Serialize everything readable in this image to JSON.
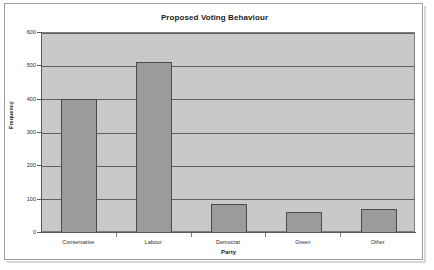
{
  "chart_data": {
    "type": "bar",
    "title": "Proposed Voting Behaviour",
    "xlabel": "Party",
    "ylabel": "Frequency",
    "categories": [
      "Conservative",
      "Labour",
      "Democrat",
      "Green",
      "Other"
    ],
    "values": [
      402,
      513,
      87,
      62,
      73
    ],
    "ylim": [
      0,
      600
    ],
    "yticks": [
      0,
      100,
      200,
      300,
      400,
      500,
      600
    ],
    "ytick_labels": [
      "0",
      "100",
      "200",
      "300",
      "400",
      "500",
      "600"
    ],
    "grid": "horizontal",
    "legend": "none",
    "colors": {
      "bar_fill": "#9b9b9b",
      "bar_border": "#4b4b4b",
      "plot_background": "#c9c9c9",
      "gridline": "#5f5f5f",
      "axis": "#5a5a5a",
      "page_background": "#ffffff",
      "frame_border": "#9d9d9d",
      "text": "#1f1f1f"
    }
  }
}
